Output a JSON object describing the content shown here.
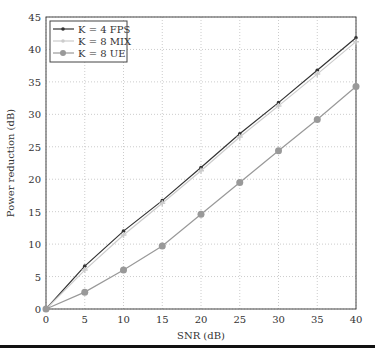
{
  "chart_data": {
    "type": "line",
    "title": "",
    "xlabel": "SNR (dB)",
    "ylabel": "Power reduction (dB)",
    "x": [
      0,
      5,
      10,
      15,
      20,
      25,
      30,
      35,
      40
    ],
    "xlim": [
      0,
      40
    ],
    "ylim": [
      0,
      45
    ],
    "xticks": [
      0,
      5,
      10,
      15,
      20,
      25,
      30,
      35,
      40
    ],
    "yticks": [
      0,
      5,
      10,
      15,
      20,
      25,
      30,
      35,
      40,
      45
    ],
    "grid": true,
    "legend_position": "upper left",
    "series": [
      {
        "name": "K = 4 FPS",
        "color": "#333333",
        "marker": "star",
        "values": [
          0,
          6.6,
          12.0,
          16.7,
          21.8,
          27.0,
          31.8,
          36.8,
          41.8
        ]
      },
      {
        "name": "K = 8 MIX",
        "color": "#cccccc",
        "marker": "plus",
        "values": [
          0,
          6.0,
          11.4,
          16.3,
          21.3,
          26.5,
          31.3,
          36.2,
          41.2
        ]
      },
      {
        "name": "K = 8 UE",
        "color": "#999999",
        "marker": "circle",
        "values": [
          0,
          2.6,
          6.0,
          9.7,
          14.6,
          19.5,
          24.4,
          29.2,
          34.3
        ]
      }
    ]
  }
}
